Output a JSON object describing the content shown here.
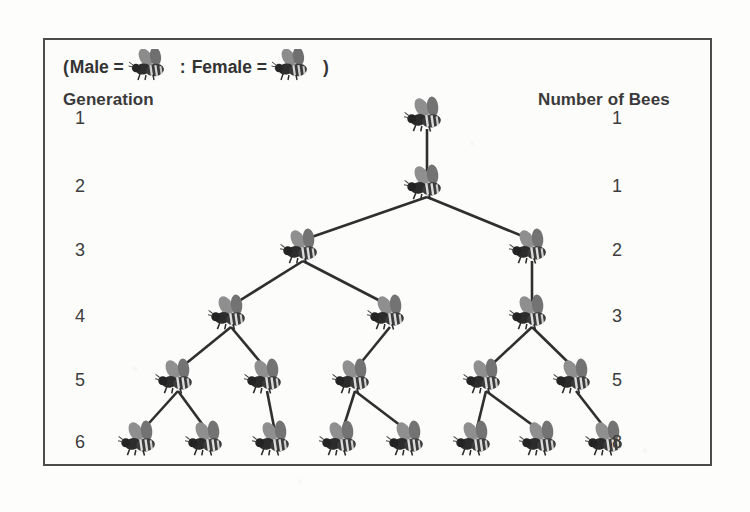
{
  "figure": {
    "legend": {
      "open_paren": "(",
      "male_label": "Male =",
      "separator": ":",
      "female_label": "Female =",
      "close_paren": ")",
      "male_icon": "bee-icon",
      "female_icon": "bee-icon"
    },
    "left_header": "Generation",
    "right_header": "Number of Bees",
    "border_color": "#4c4c4c",
    "background_color": "#fcfcfb",
    "text_color": "#3a3a3a",
    "line_color": "#2f2f2f"
  },
  "chart_data": {
    "type": "diagram",
    "xlabel": "",
    "ylabel": "",
    "categories": [
      "1",
      "2",
      "3",
      "4",
      "5",
      "6"
    ],
    "values": [
      1,
      1,
      2,
      3,
      5,
      8
    ],
    "series": [
      {
        "name": "Number of Bees",
        "values": [
          1,
          1,
          2,
          3,
          5,
          8
        ]
      }
    ],
    "generations": [
      {
        "generation": "1",
        "count": "1",
        "y": 80,
        "nodes": [
          {
            "id": "g1n0",
            "x": 382
          }
        ]
      },
      {
        "generation": "2",
        "count": "1",
        "y": 148,
        "nodes": [
          {
            "id": "g2n0",
            "x": 382
          }
        ]
      },
      {
        "generation": "3",
        "count": "2",
        "y": 212,
        "nodes": [
          {
            "id": "g3n0",
            "x": 258
          },
          {
            "id": "g3n1",
            "x": 487
          }
        ]
      },
      {
        "generation": "4",
        "count": "3",
        "y": 278,
        "nodes": [
          {
            "id": "g4n0",
            "x": 186
          },
          {
            "id": "g4n1",
            "x": 345
          },
          {
            "id": "g4n2",
            "x": 487
          }
        ]
      },
      {
        "generation": "5",
        "count": "5",
        "y": 342,
        "nodes": [
          {
            "id": "g5n0",
            "x": 133
          },
          {
            "id": "g5n1",
            "x": 222
          },
          {
            "id": "g5n2",
            "x": 310
          },
          {
            "id": "g5n3",
            "x": 441
          },
          {
            "id": "g5n4",
            "x": 531
          }
        ]
      },
      {
        "generation": "6",
        "count": "8",
        "y": 404,
        "nodes": [
          {
            "id": "g6n0",
            "x": 96
          },
          {
            "id": "g6n1",
            "x": 163
          },
          {
            "id": "g6n2",
            "x": 230
          },
          {
            "id": "g6n3",
            "x": 297
          },
          {
            "id": "g6n4",
            "x": 364
          },
          {
            "id": "g6n5",
            "x": 431
          },
          {
            "id": "g6n6",
            "x": 497
          },
          {
            "id": "g6n7",
            "x": 563
          }
        ]
      }
    ],
    "edges": [
      [
        "g1n0",
        "g2n0"
      ],
      [
        "g2n0",
        "g3n0"
      ],
      [
        "g2n0",
        "g3n1"
      ],
      [
        "g3n0",
        "g4n0"
      ],
      [
        "g3n0",
        "g4n1"
      ],
      [
        "g3n1",
        "g4n2"
      ],
      [
        "g4n0",
        "g5n0"
      ],
      [
        "g4n0",
        "g5n1"
      ],
      [
        "g4n1",
        "g5n2"
      ],
      [
        "g4n2",
        "g5n3"
      ],
      [
        "g4n2",
        "g5n4"
      ],
      [
        "g5n0",
        "g6n0"
      ],
      [
        "g5n0",
        "g6n1"
      ],
      [
        "g5n1",
        "g6n2"
      ],
      [
        "g5n2",
        "g6n3"
      ],
      [
        "g5n2",
        "g6n4"
      ],
      [
        "g5n3",
        "g6n5"
      ],
      [
        "g5n3",
        "g6n6"
      ],
      [
        "g5n4",
        "g6n7"
      ]
    ],
    "generation_label_x": 30,
    "count_label_x": 567,
    "grid": false,
    "legend_position": "top-left"
  }
}
